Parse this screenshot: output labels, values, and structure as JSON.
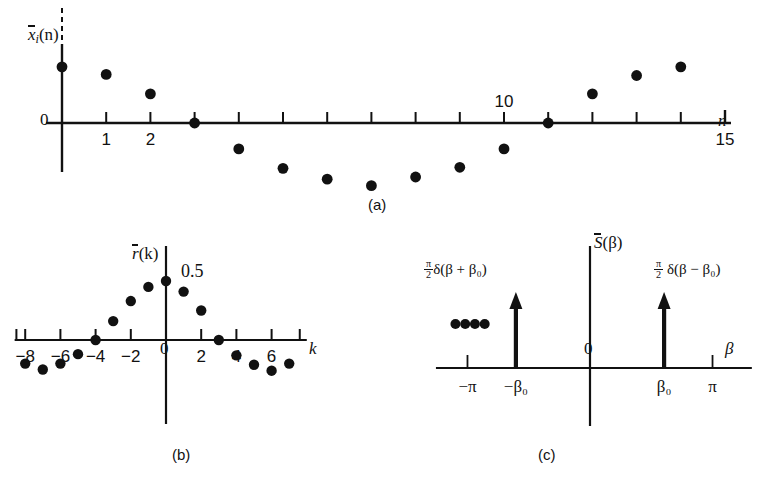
{
  "figure": {
    "dot_color": "#111111",
    "axis_color": "#111111"
  },
  "panels": [
    {
      "id": "a",
      "caption": "(a)",
      "ylabel": "x̄ᵢ(n)",
      "ylabel_base": "x",
      "ylabel_sub": "i",
      "ylabel_arg": "(n)",
      "xlabel": "n",
      "origin_label": "0",
      "xticks": [
        {
          "value": 1,
          "label": "1"
        },
        {
          "value": 2,
          "label": "2"
        },
        {
          "value": 3,
          "label": ""
        },
        {
          "value": 4,
          "label": ""
        },
        {
          "value": 5,
          "label": ""
        },
        {
          "value": 6,
          "label": ""
        },
        {
          "value": 7,
          "label": ""
        },
        {
          "value": 8,
          "label": ""
        },
        {
          "value": 9,
          "label": ""
        },
        {
          "value": 10,
          "label": "10"
        },
        {
          "value": 11,
          "label": ""
        },
        {
          "value": 12,
          "label": ""
        },
        {
          "value": 13,
          "label": ""
        },
        {
          "value": 14,
          "label": ""
        },
        {
          "value": 15,
          "label": "15"
        }
      ],
      "dashed_top_axis": true
    },
    {
      "id": "b",
      "caption": "(b)",
      "ylabel": "r̄(k)",
      "ylabel_base": "r",
      "ylabel_arg": "(k)",
      "xlabel": "k",
      "origin_label": "0",
      "peak_label": "0.5",
      "xticks": [
        {
          "value": -8,
          "label": "−8"
        },
        {
          "value": -6,
          "label": "−6"
        },
        {
          "value": -4,
          "label": "−4"
        },
        {
          "value": -2,
          "label": "−2"
        },
        {
          "value": 2,
          "label": "2"
        },
        {
          "value": 4,
          "label": "4"
        },
        {
          "value": 6,
          "label": "6"
        }
      ]
    },
    {
      "id": "c",
      "caption": "(c)",
      "ylabel": "S̄(β)",
      "ylabel_base": "S",
      "ylabel_arg": "(β)",
      "xlabel": "β",
      "origin_label": "0",
      "xticks": [
        {
          "value": -3.1416,
          "label": "−π"
        },
        {
          "value": -1.9,
          "label": "−β₀"
        },
        {
          "value": 1.9,
          "label": "β₀"
        },
        {
          "value": 3.1416,
          "label": "π"
        }
      ],
      "impulse_left_label": {
        "coef_num": "π",
        "coef_den": "2",
        "body": "δ(β + β₀)"
      },
      "impulse_right_label": {
        "coef_num": "π",
        "coef_den": "2",
        "body": "δ(β − β₀)"
      },
      "continuation_dots": 4
    }
  ],
  "chart_data": [
    {
      "type": "scatter",
      "panel": "a",
      "title": "(a)",
      "xlabel": "n",
      "ylabel": "x̄ᵢ(n)",
      "xlim": [
        -0.6,
        15.5
      ],
      "ylim": [
        -0.78,
        0.62
      ],
      "grid": false,
      "legend": null,
      "x": [
        0,
        1,
        2,
        3,
        4,
        5,
        6,
        7,
        8,
        9,
        10,
        11,
        12,
        13,
        14
      ],
      "values": [
        0.52,
        0.45,
        0.27,
        0.0,
        -0.24,
        -0.42,
        -0.52,
        -0.58,
        -0.5,
        -0.41,
        -0.24,
        0.0,
        0.27,
        0.44,
        0.52
      ]
    },
    {
      "type": "scatter",
      "panel": "b",
      "title": "(b)",
      "xlabel": "k",
      "ylabel": "r̄(k)",
      "xlim": [
        -8.6,
        8.0
      ],
      "ylim": [
        -0.34,
        0.58
      ],
      "grid": false,
      "legend": null,
      "annotations": [
        {
          "text": "0.5",
          "x": 0,
          "y": 0.5
        }
      ],
      "x": [
        -8,
        -7,
        -6,
        -5,
        -4,
        -3,
        -2,
        -1,
        0,
        1,
        2,
        3,
        4,
        5,
        6,
        7
      ],
      "values": [
        -0.2,
        -0.25,
        -0.2,
        -0.12,
        0.0,
        0.16,
        0.33,
        0.45,
        0.5,
        0.41,
        0.25,
        0.0,
        -0.13,
        -0.21,
        -0.26,
        -0.2
      ]
    },
    {
      "type": "line",
      "panel": "c",
      "title": "(c)",
      "xlabel": "β",
      "ylabel": "S̄(β)",
      "xlim": [
        -3.9,
        4.2
      ],
      "ylim": [
        0,
        1.15
      ],
      "grid": false,
      "legend": null,
      "impulses": [
        {
          "x": -1.9,
          "height": 1.0,
          "label": "π/2 δ(β + β₀)"
        },
        {
          "x": 1.9,
          "height": 1.0,
          "label": "π/2 δ(β − β₀)"
        }
      ],
      "continuation_dots_x": [
        -3.45,
        -3.2,
        -2.95,
        -2.7
      ]
    }
  ]
}
